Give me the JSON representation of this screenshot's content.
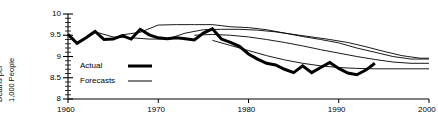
{
  "chart_data": {
    "type": "line",
    "title": "",
    "xlabel": "",
    "ylabel": "Deaths per 1,000 People",
    "ylabel_lines": [
      "Deaths per",
      "1,000 People"
    ],
    "xlim": [
      1960,
      2000
    ],
    "ylim": [
      8,
      10
    ],
    "yticks": [
      8,
      8.5,
      9,
      9.5,
      10
    ],
    "ytick_labels": [
      "8",
      "8.5",
      "9",
      "9.5",
      "10"
    ],
    "yminor_step": 0.1,
    "xticks": [
      1960,
      1970,
      1980,
      1990,
      2000
    ],
    "xtick_labels": [
      "1960",
      "1970",
      "1980",
      "1990",
      "2000"
    ],
    "grid": false,
    "legend_position": "inside-left",
    "legend": [
      {
        "name": "Actual",
        "style": "thick"
      },
      {
        "name": "Forecasts",
        "style": "thin"
      }
    ],
    "series": [
      {
        "name": "Actual",
        "style": "thick",
        "x": [
          1960,
          1961,
          1962,
          1963,
          1964,
          1965,
          1966,
          1967,
          1968,
          1969,
          1970,
          1971,
          1972,
          1973,
          1974,
          1975,
          1976,
          1977,
          1978,
          1979,
          1980,
          1981,
          1982,
          1983,
          1984,
          1985,
          1986,
          1987,
          1988,
          1989,
          1990,
          1991,
          1992,
          1993,
          1994
        ],
        "y": [
          9.52,
          9.31,
          9.44,
          9.59,
          9.4,
          9.41,
          9.49,
          9.41,
          9.64,
          9.51,
          9.44,
          9.42,
          9.44,
          9.42,
          9.39,
          9.55,
          9.65,
          9.41,
          9.33,
          9.24,
          9.06,
          8.94,
          8.84,
          8.8,
          8.7,
          8.62,
          8.78,
          8.62,
          8.74,
          8.86,
          8.72,
          8.61,
          8.57,
          8.68,
          8.84
        ],
        "x_end": 1994
      },
      {
        "name": "Forecast 1",
        "style": "thin",
        "x": [
          1966,
          1968,
          1970,
          1972,
          1974,
          1976,
          1978,
          1980,
          1982,
          1984,
          1986,
          1988,
          1990,
          1992,
          1994,
          1996,
          1998,
          2000
        ],
        "y": [
          9.51,
          9.57,
          9.74,
          9.75,
          9.75,
          9.75,
          9.7,
          9.68,
          9.63,
          9.55,
          9.47,
          9.4,
          9.32,
          9.2,
          9.1,
          9.0,
          8.94,
          8.94
        ]
      },
      {
        "name": "Forecast 2",
        "style": "thin",
        "x": [
          1963,
          1965,
          1967,
          1969,
          1971,
          1973,
          1975,
          1977,
          1979,
          1981,
          1983,
          1985,
          1987,
          1989,
          1991,
          1993,
          1995,
          1997,
          1999,
          2000
        ],
        "y": [
          9.58,
          9.46,
          9.44,
          9.41,
          9.41,
          9.55,
          9.63,
          9.64,
          9.64,
          9.62,
          9.58,
          9.52,
          9.46,
          9.4,
          9.33,
          9.23,
          9.12,
          9.02,
          8.96,
          8.96
        ]
      },
      {
        "name": "Forecast 3",
        "style": "thin",
        "x": [
          1974,
          1976,
          1978,
          1980,
          1982,
          1984,
          1986,
          1988,
          1990,
          1992,
          1994,
          1996,
          1998,
          2000
        ],
        "y": [
          9.5,
          9.52,
          9.5,
          9.46,
          9.4,
          9.33,
          9.25,
          9.16,
          9.08,
          9.0,
          8.93,
          8.87,
          8.84,
          8.84
        ]
      },
      {
        "name": "Forecast 4",
        "style": "thin",
        "x": [
          1976,
          1978,
          1980,
          1982,
          1984,
          1986,
          1988,
          1990,
          1992,
          1994,
          1996,
          1998,
          2000
        ],
        "y": [
          9.38,
          9.26,
          9.14,
          9.02,
          8.92,
          8.84,
          8.78,
          8.74,
          8.72,
          8.71,
          8.71,
          8.71,
          8.71
        ]
      }
    ]
  }
}
